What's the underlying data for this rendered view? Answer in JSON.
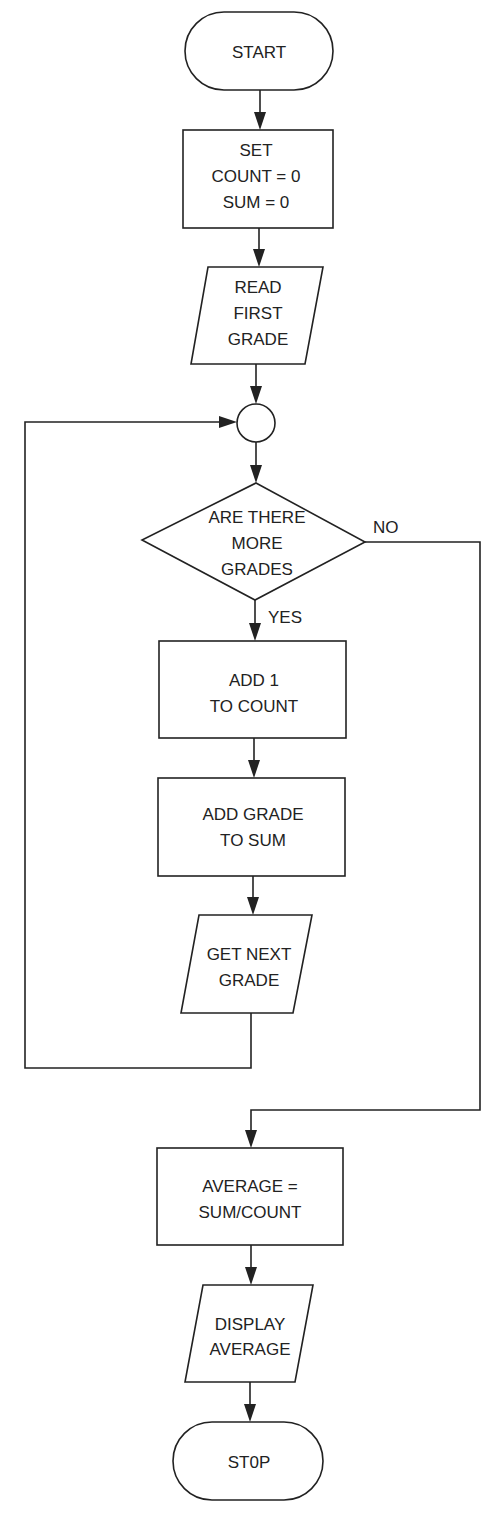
{
  "diagram": {
    "type": "flowchart",
    "nodes": {
      "start": {
        "shape": "terminal",
        "lines": [
          "START"
        ]
      },
      "init": {
        "shape": "process",
        "lines": [
          "SET",
          "COUNT = 0",
          "SUM = 0"
        ]
      },
      "read_first": {
        "shape": "input-output",
        "lines": [
          "READ",
          "FIRST",
          "GRADE"
        ]
      },
      "connector": {
        "shape": "connector",
        "lines": []
      },
      "decision": {
        "shape": "decision",
        "lines": [
          "ARE THERE",
          "MORE",
          "GRADES"
        ]
      },
      "add_count": {
        "shape": "process",
        "lines": [
          "ADD 1",
          "TO COUNT"
        ]
      },
      "add_sum": {
        "shape": "process",
        "lines": [
          "ADD GRADE",
          "TO SUM"
        ]
      },
      "get_next": {
        "shape": "input-output",
        "lines": [
          "GET NEXT",
          "GRADE"
        ]
      },
      "average": {
        "shape": "process",
        "lines": [
          "AVERAGE =",
          "SUM/COUNT"
        ]
      },
      "display": {
        "shape": "input-output",
        "lines": [
          "DISPLAY",
          "AVERAGE"
        ]
      },
      "stop": {
        "shape": "terminal",
        "lines": [
          "ST0P"
        ]
      }
    },
    "edges": {
      "yes_label": "YES",
      "no_label": "NO",
      "list": [
        {
          "from": "start",
          "to": "init"
        },
        {
          "from": "init",
          "to": "read_first"
        },
        {
          "from": "read_first",
          "to": "connector"
        },
        {
          "from": "connector",
          "to": "decision"
        },
        {
          "from": "decision",
          "to": "add_count",
          "label": "YES"
        },
        {
          "from": "add_count",
          "to": "add_sum"
        },
        {
          "from": "add_sum",
          "to": "get_next"
        },
        {
          "from": "get_next",
          "to": "connector",
          "note": "loop back"
        },
        {
          "from": "decision",
          "to": "average",
          "label": "NO"
        },
        {
          "from": "average",
          "to": "display"
        },
        {
          "from": "display",
          "to": "stop"
        }
      ]
    },
    "colors": {
      "stroke": "#222222",
      "fill": "#ffffff",
      "text": "#222222"
    }
  }
}
